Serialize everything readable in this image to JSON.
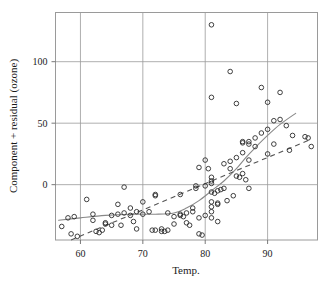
{
  "chart_data": {
    "type": "scatter",
    "title": "",
    "xlabel": "Temp.",
    "ylabel": "Component + residual (ozone)",
    "xlim": [
      56,
      98
    ],
    "ylim": [
      -45,
      140
    ],
    "xticks": [
      60,
      70,
      80,
      90
    ],
    "yticks": [
      0,
      50,
      100
    ],
    "xtick_labels": [
      "60",
      "70",
      "80",
      "90"
    ],
    "ytick_labels": [
      "0",
      "50",
      "100"
    ],
    "grid": true,
    "legend": "none",
    "marker": "open-circle",
    "points": [
      {
        "x": 57,
        "y": -34
      },
      {
        "x": 58,
        "y": -27
      },
      {
        "x": 58.5,
        "y": -40
      },
      {
        "x": 59,
        "y": -26
      },
      {
        "x": 59.5,
        "y": -42
      },
      {
        "x": 61,
        "y": -12
      },
      {
        "x": 62,
        "y": -24
      },
      {
        "x": 62,
        "y": -29
      },
      {
        "x": 62.5,
        "y": -38
      },
      {
        "x": 63,
        "y": -39
      },
      {
        "x": 63.5,
        "y": -37
      },
      {
        "x": 64,
        "y": -31
      },
      {
        "x": 64,
        "y": -32
      },
      {
        "x": 65,
        "y": -25
      },
      {
        "x": 65,
        "y": -33
      },
      {
        "x": 66,
        "y": -16
      },
      {
        "x": 66,
        "y": -24
      },
      {
        "x": 66.5,
        "y": -33
      },
      {
        "x": 67,
        "y": -2
      },
      {
        "x": 67,
        "y": -23
      },
      {
        "x": 68,
        "y": -19
      },
      {
        "x": 68,
        "y": -25
      },
      {
        "x": 68.5,
        "y": -30
      },
      {
        "x": 69,
        "y": -22
      },
      {
        "x": 69,
        "y": -36
      },
      {
        "x": 70,
        "y": -14
      },
      {
        "x": 70,
        "y": -24
      },
      {
        "x": 71,
        "y": -22
      },
      {
        "x": 71.5,
        "y": -37
      },
      {
        "x": 72,
        "y": -8
      },
      {
        "x": 72,
        "y": -9
      },
      {
        "x": 72,
        "y": -37
      },
      {
        "x": 73,
        "y": -36
      },
      {
        "x": 73,
        "y": -38
      },
      {
        "x": 73.5,
        "y": -38
      },
      {
        "x": 74,
        "y": -23
      },
      {
        "x": 74,
        "y": -37
      },
      {
        "x": 75,
        "y": -26
      },
      {
        "x": 75,
        "y": -32
      },
      {
        "x": 76,
        "y": -8
      },
      {
        "x": 76,
        "y": -24
      },
      {
        "x": 76,
        "y": -25
      },
      {
        "x": 76.5,
        "y": -26
      },
      {
        "x": 77,
        "y": -23
      },
      {
        "x": 77,
        "y": -31
      },
      {
        "x": 77.5,
        "y": -33
      },
      {
        "x": 78,
        "y": -19
      },
      {
        "x": 78,
        "y": -22
      },
      {
        "x": 78.5,
        "y": -1
      },
      {
        "x": 78.5,
        "y": -3
      },
      {
        "x": 79,
        "y": 14
      },
      {
        "x": 79,
        "y": -27
      },
      {
        "x": 79,
        "y": -40
      },
      {
        "x": 79.5,
        "y": -41
      },
      {
        "x": 80,
        "y": 20
      },
      {
        "x": 80,
        "y": -1
      },
      {
        "x": 80,
        "y": -25
      },
      {
        "x": 80.5,
        "y": 13
      },
      {
        "x": 81,
        "y": 130
      },
      {
        "x": 81,
        "y": 71
      },
      {
        "x": 81,
        "y": 6
      },
      {
        "x": 81,
        "y": 3
      },
      {
        "x": 81,
        "y": 1
      },
      {
        "x": 81,
        "y": -6
      },
      {
        "x": 81,
        "y": -14
      },
      {
        "x": 81,
        "y": -18
      },
      {
        "x": 81,
        "y": -22
      },
      {
        "x": 81,
        "y": -27
      },
      {
        "x": 81.5,
        "y": -7
      },
      {
        "x": 82,
        "y": -5
      },
      {
        "x": 82,
        "y": -15
      },
      {
        "x": 82,
        "y": -16
      },
      {
        "x": 82,
        "y": -30
      },
      {
        "x": 82.5,
        "y": -4
      },
      {
        "x": 83,
        "y": -3
      },
      {
        "x": 83,
        "y": 17
      },
      {
        "x": 83.5,
        "y": -13
      },
      {
        "x": 84,
        "y": 92
      },
      {
        "x": 84,
        "y": 19
      },
      {
        "x": 84,
        "y": 13
      },
      {
        "x": 84.5,
        "y": -9
      },
      {
        "x": 85,
        "y": 66
      },
      {
        "x": 85,
        "y": 22
      },
      {
        "x": 85,
        "y": 7
      },
      {
        "x": 85.5,
        "y": 6
      },
      {
        "x": 86,
        "y": 35
      },
      {
        "x": 86,
        "y": 34
      },
      {
        "x": 86,
        "y": 26
      },
      {
        "x": 86,
        "y": 9
      },
      {
        "x": 86.5,
        "y": 4
      },
      {
        "x": 87,
        "y": 35
      },
      {
        "x": 87,
        "y": 33
      },
      {
        "x": 87,
        "y": 20
      },
      {
        "x": 87,
        "y": -3
      },
      {
        "x": 88,
        "y": 38
      },
      {
        "x": 88,
        "y": 31
      },
      {
        "x": 89,
        "y": 79
      },
      {
        "x": 89,
        "y": 42
      },
      {
        "x": 90,
        "y": 67
      },
      {
        "x": 90,
        "y": 45
      },
      {
        "x": 90,
        "y": 25
      },
      {
        "x": 91,
        "y": 52
      },
      {
        "x": 91,
        "y": 33
      },
      {
        "x": 92,
        "y": 53
      },
      {
        "x": 92,
        "y": 75
      },
      {
        "x": 93,
        "y": 48
      },
      {
        "x": 93.5,
        "y": 28
      },
      {
        "x": 94,
        "y": 40
      },
      {
        "x": 96,
        "y": 39
      },
      {
        "x": 96.5,
        "y": 38
      },
      {
        "x": 97,
        "y": 31
      }
    ],
    "smooth_curve": {
      "name": "lowess-smooth",
      "style": "solid",
      "color": "#888888",
      "points": [
        {
          "x": 56.5,
          "y": -29
        },
        {
          "x": 60,
          "y": -27
        },
        {
          "x": 64,
          "y": -25
        },
        {
          "x": 68,
          "y": -24
        },
        {
          "x": 72,
          "y": -24
        },
        {
          "x": 75,
          "y": -23
        },
        {
          "x": 77,
          "y": -19
        },
        {
          "x": 79,
          "y": -13
        },
        {
          "x": 81,
          "y": -5
        },
        {
          "x": 83,
          "y": 3
        },
        {
          "x": 85,
          "y": 13
        },
        {
          "x": 86.5,
          "y": 22
        },
        {
          "x": 88,
          "y": 30
        },
        {
          "x": 90,
          "y": 40
        },
        {
          "x": 92,
          "y": 49
        },
        {
          "x": 94.5,
          "y": 58
        }
      ]
    },
    "fit_line": {
      "name": "linear-fit",
      "style": "dashed",
      "color": "#555555",
      "points": [
        {
          "x": 58.5,
          "y": -45
        },
        {
          "x": 97,
          "y": 37
        }
      ]
    }
  }
}
